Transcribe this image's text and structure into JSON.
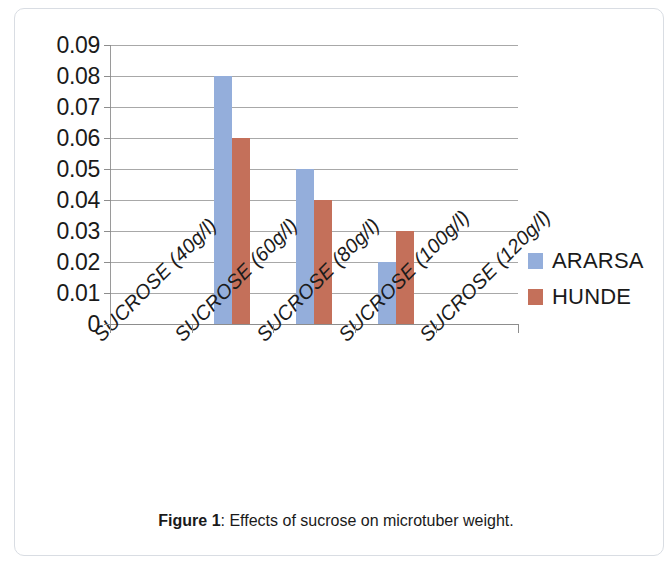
{
  "figure": {
    "caption_label": "Figure 1",
    "caption_separator": ": ",
    "caption_text": "Effects of sucrose on microtuber weight."
  },
  "legend": {
    "position": "right",
    "items": [
      {
        "label": "ARARSA",
        "color": "#94aedb"
      },
      {
        "label": "HUNDE",
        "color": "#c4705a"
      }
    ]
  },
  "axis": {
    "y_ticks": [
      "0.09",
      "0.08",
      "0.07",
      "0.06",
      "0.05",
      "0.04",
      "0.03",
      "0.02",
      "0.01",
      "0"
    ]
  },
  "chart_data": {
    "type": "bar",
    "title": "",
    "xlabel": "",
    "ylabel": "",
    "ylim": [
      0,
      0.09
    ],
    "ytick_values": [
      0,
      0.01,
      0.02,
      0.03,
      0.04,
      0.05,
      0.06,
      0.07,
      0.08,
      0.09
    ],
    "grid": true,
    "legend_position": "right",
    "categories": [
      "SUCROSE (40g/l)",
      "SUCROSE (60g/l)",
      "SUCROSE (80g/l)",
      "SUCROSE (100g/l)",
      "SUCROSE (120g/l)"
    ],
    "series": [
      {
        "name": "ARARSA",
        "color": "#94aedb",
        "values": [
          0,
          0.08,
          0.05,
          0.02,
          0
        ]
      },
      {
        "name": "HUNDE",
        "color": "#c4705a",
        "values": [
          0,
          0.06,
          0.04,
          0.03,
          0
        ]
      }
    ]
  }
}
